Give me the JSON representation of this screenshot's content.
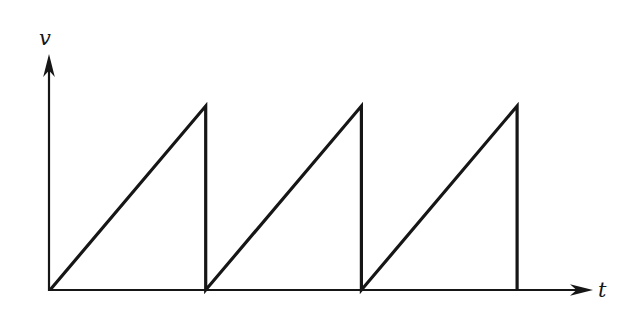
{
  "figure": {
    "background": "#ffffff",
    "line_color": "#161616",
    "line_width": 3.2,
    "axis_width": 2.2
  },
  "chart_data": {
    "type": "line",
    "xlabel": "t",
    "ylabel": "v",
    "x_unit": "periods (T)",
    "y_unit": "peak amplitude (V)",
    "xlim": [
      0,
      3.48
    ],
    "ylim": [
      0,
      1.28
    ],
    "grid": false,
    "legend": "none",
    "axis_ticks": "none",
    "series": [
      {
        "name": "sawtooth",
        "points": [
          {
            "x": 0,
            "y": 0
          },
          {
            "x": 1,
            "y": 1
          },
          {
            "x": 1,
            "y": 0
          },
          {
            "x": 2,
            "y": 1
          },
          {
            "x": 2,
            "y": 0
          },
          {
            "x": 3,
            "y": 1
          },
          {
            "x": 3,
            "y": 0
          }
        ]
      }
    ]
  }
}
